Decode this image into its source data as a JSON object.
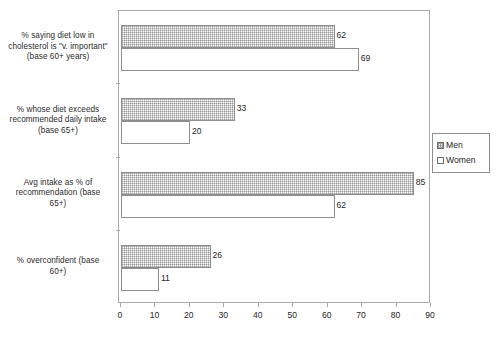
{
  "chart_data": {
    "type": "bar",
    "orientation": "horizontal",
    "title": "",
    "xlabel": "",
    "ylabel": "",
    "xlim": [
      0,
      90
    ],
    "xticks": [
      0,
      10,
      20,
      30,
      40,
      50,
      60,
      70,
      80,
      90
    ],
    "grid": false,
    "legend_position": "right",
    "categories": [
      "% saying diet low in cholesterol is \"v. important\" (base 60+ years)",
      "% whose diet exceeds recommended daily intake (base 65+)",
      "Avg intake as % of recommendation (base 65+)",
      "% overconfident (base 60+)"
    ],
    "category_lines": [
      [
        "% saying diet low in",
        "cholesterol is \"v. important\"",
        "(base 60+ years)"
      ],
      [
        "% whose diet exceeds",
        "recommended daily intake",
        "(base 65+)"
      ],
      [
        "Avg intake as % of",
        "recommendation (base",
        "65+)"
      ],
      [
        "% overconfident (base",
        "60+)"
      ]
    ],
    "series": [
      {
        "name": "Men",
        "values": [
          62,
          33,
          85,
          26
        ],
        "fill": "pattern-dotted",
        "color": "#c8c8c8"
      },
      {
        "name": "Women",
        "values": [
          69,
          20,
          62,
          11
        ],
        "fill": "solid-white",
        "color": "#ffffff"
      }
    ]
  },
  "legend": {
    "entries": [
      {
        "label": "Men"
      },
      {
        "label": "Women"
      }
    ]
  },
  "axis": {
    "tick_labels": [
      "0",
      "10",
      "20",
      "30",
      "40",
      "50",
      "60",
      "70",
      "80",
      "90"
    ]
  },
  "value_labels": {
    "group0": {
      "men": "62",
      "women": "69"
    },
    "group1": {
      "men": "33",
      "women": "20"
    },
    "group2": {
      "men": "85",
      "women": "62"
    },
    "group3": {
      "men": "26",
      "women": "11"
    }
  }
}
